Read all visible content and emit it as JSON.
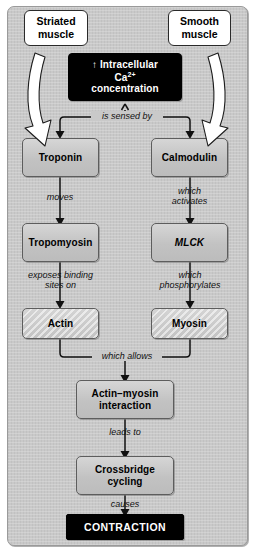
{
  "diagram": {
    "type": "flowchart",
    "colors": {
      "panel_background": "#c9c9c9",
      "node_fill": "#c4c4c4",
      "node_border": "#5d5d5d",
      "terminal_fill": "#000000",
      "terminal_text": "#ffffff",
      "callout_fill": "#ffffff",
      "connector": "#1a1a1a"
    },
    "callouts": [
      {
        "id": "striated",
        "label": "Striated\nmuscle",
        "line1": "Striated",
        "line2": "muscle",
        "side": "left"
      },
      {
        "id": "smooth",
        "label": "Smooth\nmuscle",
        "line1": "Smooth",
        "line2": "muscle",
        "side": "right"
      }
    ],
    "source_node": {
      "id": "calcium",
      "line1": "↑ Intracellular",
      "ion": "Ca",
      "ion_charge": "2+",
      "line3": "concentration",
      "style": "black"
    },
    "branches": {
      "left": {
        "name": "Striated muscle pathway",
        "nodes": [
          {
            "id": "troponin",
            "label": "Troponin",
            "style": "gray"
          },
          {
            "id": "tropomyosin",
            "label": "Tropomyosin",
            "style": "gray"
          },
          {
            "id": "actin",
            "label": "Actin",
            "style": "hatched"
          }
        ],
        "edge_labels": [
          {
            "from": "troponin",
            "to": "tropomyosin",
            "text": "moves",
            "lines": [
              "moves"
            ]
          },
          {
            "from": "tropomyosin",
            "to": "actin",
            "text": "exposes binding sites on",
            "lines": [
              "exposes binding",
              "sites on"
            ]
          }
        ]
      },
      "right": {
        "name": "Smooth muscle pathway",
        "nodes": [
          {
            "id": "calmodulin",
            "label": "Calmodulin",
            "style": "gray"
          },
          {
            "id": "mlck",
            "label": "MLCK",
            "style": "gray-italic"
          },
          {
            "id": "myosin",
            "label": "Myosin",
            "style": "hatched"
          }
        ],
        "edge_labels": [
          {
            "from": "calmodulin",
            "to": "mlck",
            "text": "which activates",
            "lines": [
              "which",
              "activates"
            ]
          },
          {
            "from": "mlck",
            "to": "myosin",
            "text": "which phosphorylates",
            "lines": [
              "which",
              "phosphorylates"
            ]
          }
        ]
      }
    },
    "split_label": {
      "text": "is sensed by"
    },
    "merge_label": {
      "text": "which allows"
    },
    "tail_nodes": [
      {
        "id": "actin-myosin-interaction",
        "line1": "Actin–myosin",
        "line2": "interaction",
        "style": "gray"
      },
      {
        "id": "crossbridge-cycling",
        "line1": "Crossbridge",
        "line2": "cycling",
        "style": "gray"
      },
      {
        "id": "contraction",
        "line1": "CONTRACTION",
        "style": "black"
      }
    ],
    "tail_edge_labels": [
      {
        "from": "actin-myosin-interaction",
        "to": "crossbridge-cycling",
        "text": "leads to"
      },
      {
        "from": "crossbridge-cycling",
        "to": "contraction",
        "text": "causes"
      }
    ]
  }
}
